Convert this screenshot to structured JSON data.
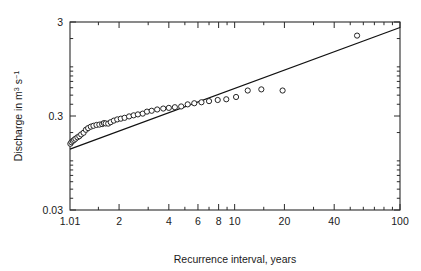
{
  "chart_data": {
    "type": "scatter",
    "title": "",
    "xlabel": "Recurrence interval, years",
    "ylabel": "Discharge in m3 s-1",
    "ylabel_parts": {
      "prefix": "Discharge in m",
      "exp1": "3",
      "mid": " s",
      "exp2": "−1"
    },
    "xscale": "log",
    "yscale": "log",
    "xlim": [
      1.01,
      100
    ],
    "ylim": [
      0.03,
      3
    ],
    "grid": false,
    "legend": null,
    "xticks_major": [
      {
        "value": 1.01,
        "label": "1.01"
      },
      {
        "value": 2,
        "label": "2"
      },
      {
        "value": 4,
        "label": "4"
      },
      {
        "value": 6,
        "label": "6"
      },
      {
        "value": 8,
        "label": "8"
      },
      {
        "value": 10,
        "label": "10"
      },
      {
        "value": 20,
        "label": "20"
      },
      {
        "value": 40,
        "label": "40"
      },
      {
        "value": 100,
        "label": "100"
      }
    ],
    "xticks_minor": [
      1.5,
      3,
      5,
      7,
      9,
      15,
      30,
      50,
      60,
      70,
      80,
      90
    ],
    "yticks_major": [
      {
        "value": 3,
        "label": "3"
      },
      {
        "value": 0.3,
        "label": "0.3"
      },
      {
        "value": 0.03,
        "label": "0.03"
      }
    ],
    "yticks_minor": [
      0.04,
      0.05,
      0.06,
      0.07,
      0.08,
      0.09,
      0.1,
      0.2,
      0.4,
      0.5,
      0.6,
      0.7,
      0.8,
      0.9,
      1,
      2
    ],
    "marker": "open-circle",
    "marker_size_px": 5.2,
    "series": [
      {
        "name": "observed discharge",
        "points": [
          [
            1.015,
            0.152
          ],
          [
            1.03,
            0.158
          ],
          [
            1.05,
            0.163
          ],
          [
            1.07,
            0.167
          ],
          [
            1.09,
            0.172
          ],
          [
            1.12,
            0.178
          ],
          [
            1.15,
            0.183
          ],
          [
            1.18,
            0.191
          ],
          [
            1.22,
            0.199
          ],
          [
            1.26,
            0.214
          ],
          [
            1.3,
            0.223
          ],
          [
            1.35,
            0.231
          ],
          [
            1.4,
            0.236
          ],
          [
            1.46,
            0.241
          ],
          [
            1.52,
            0.243
          ],
          [
            1.58,
            0.246
          ],
          [
            1.62,
            0.252
          ],
          [
            1.66,
            0.25
          ],
          [
            1.72,
            0.249
          ],
          [
            1.78,
            0.258
          ],
          [
            1.86,
            0.268
          ],
          [
            1.95,
            0.276
          ],
          [
            2.05,
            0.281
          ],
          [
            2.16,
            0.287
          ],
          [
            2.3,
            0.297
          ],
          [
            2.45,
            0.305
          ],
          [
            2.6,
            0.312
          ],
          [
            2.78,
            0.318
          ],
          [
            2.95,
            0.334
          ],
          [
            3.15,
            0.341
          ],
          [
            3.4,
            0.352
          ],
          [
            3.7,
            0.36
          ],
          [
            4.0,
            0.366
          ],
          [
            4.35,
            0.372
          ],
          [
            4.75,
            0.379
          ],
          [
            5.2,
            0.399
          ],
          [
            5.7,
            0.41
          ],
          [
            6.3,
            0.42
          ],
          [
            7.0,
            0.432
          ],
          [
            7.9,
            0.444
          ],
          [
            8.9,
            0.452
          ],
          [
            10.2,
            0.478
          ],
          [
            12.0,
            0.56
          ],
          [
            14.5,
            0.576
          ],
          [
            19.5,
            0.56
          ],
          [
            55.0,
            2.15
          ]
        ]
      }
    ],
    "fit_line": {
      "name": "fitted regression line",
      "start": [
        1.01,
        0.133
      ],
      "end": [
        100.0,
        2.62
      ]
    }
  }
}
